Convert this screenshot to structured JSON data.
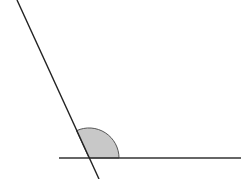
{
  "diagram": {
    "type": "angle",
    "background": "#ffffff",
    "stroke_color": "#333333",
    "fill_color": "#c8c8c8",
    "vertex": {
      "x": 89,
      "y": 158
    },
    "horizontal_ray": {
      "x1": 59,
      "y1": 158,
      "x2": 241,
      "y2": 158
    },
    "slanted_line": {
      "x1": 17,
      "y1": 0,
      "x2": 99,
      "y2": 179
    },
    "angle_marker": {
      "radius": 30,
      "shaded": true,
      "description": "obtuse angle marked with shaded arc"
    }
  }
}
